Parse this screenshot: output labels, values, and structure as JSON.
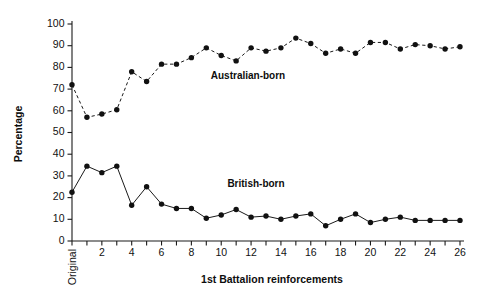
{
  "chart_data": {
    "type": "line",
    "title": "",
    "xlabel": "1st Battalion reinforcements",
    "ylabel": "Percentage",
    "ylim": [
      0,
      100
    ],
    "ytick_step": 10,
    "yticks": [
      0,
      10,
      20,
      30,
      40,
      50,
      60,
      70,
      80,
      90,
      100
    ],
    "categories": [
      "Original",
      "1",
      "2",
      "3",
      "4",
      "5",
      "6",
      "7",
      "8",
      "9",
      "10",
      "11",
      "12",
      "13",
      "14",
      "15",
      "16",
      "17",
      "18",
      "19",
      "20",
      "21",
      "22",
      "23",
      "24",
      "25",
      "26"
    ],
    "xtick_labels_shown": [
      "Original",
      "2",
      "4",
      "6",
      "8",
      "10",
      "12",
      "14",
      "16",
      "18",
      "20",
      "22",
      "24",
      "26"
    ],
    "grid": false,
    "legend_position": "inline-annotations",
    "series": [
      {
        "name": "Australian-born",
        "line_style": "dashed",
        "marker": "filled-circle",
        "color": "#111111",
        "values": [
          72,
          57,
          58.5,
          60.5,
          78,
          73.5,
          81.5,
          81.5,
          84.5,
          89,
          85.5,
          83,
          89,
          87.5,
          89,
          93.5,
          91,
          86.5,
          88.5,
          86.5,
          91.5,
          91.5,
          88.5,
          90.5,
          90,
          88.5,
          89.5
        ],
        "label_position": {
          "x": 248,
          "y": 79
        }
      },
      {
        "name": "British-born",
        "line_style": "solid",
        "marker": "filled-circle",
        "color": "#111111",
        "values": [
          22.5,
          34.5,
          31.5,
          34.5,
          16.5,
          25,
          17,
          15,
          15,
          10.5,
          12,
          14.5,
          11,
          11.5,
          10,
          11.5,
          12.5,
          7,
          10,
          12.5,
          8.5,
          10,
          11,
          9.5,
          9.5,
          9.5,
          9.5
        ],
        "label_position": {
          "x": 256,
          "y": 187
        }
      }
    ]
  },
  "axis_titles": {
    "x": "1st Battalion reinforcements",
    "y": "Percentage"
  }
}
